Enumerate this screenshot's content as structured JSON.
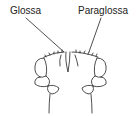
{
  "diagram": {
    "labels": [
      {
        "id": "glossa",
        "text": "Glossa"
      },
      {
        "id": "paraglossa",
        "text": "Paraglossa"
      }
    ],
    "colors": {
      "stroke": "#222222",
      "background": "#ffffff"
    }
  }
}
